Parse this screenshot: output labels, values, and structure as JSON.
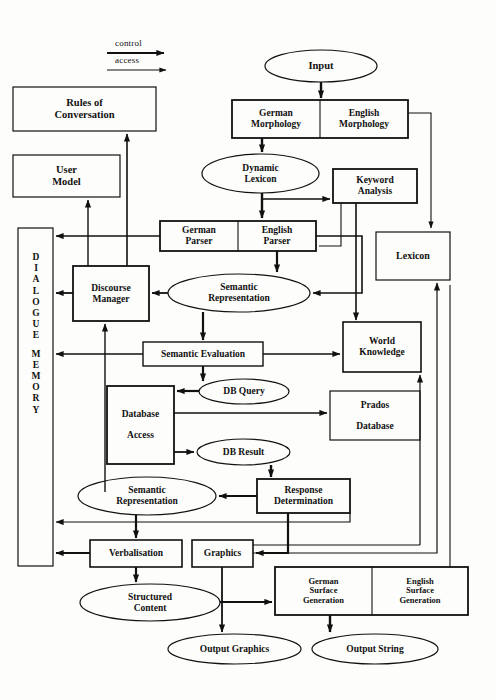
{
  "diagram": {
    "legend": {
      "control_label": "control",
      "access_label": "access"
    },
    "memory_box": {
      "label": "DIALOGUE MEMORY",
      "letters": [
        "D",
        "I",
        "A",
        "L",
        "O",
        "G",
        "U",
        "E",
        "",
        "M",
        "E",
        "M",
        "O",
        "R",
        "Y"
      ]
    },
    "nodes": [
      {
        "id": "rules_of_conversation",
        "label": "Rules of\nConversation",
        "shape": "rect",
        "x": 13,
        "y": 87,
        "w": 143,
        "h": 44,
        "fs": 10.5
      },
      {
        "id": "user_model",
        "label": "User\nModel",
        "shape": "rect",
        "x": 13,
        "y": 155,
        "w": 107,
        "h": 42,
        "fs": 10.5
      },
      {
        "id": "input",
        "label": "Input",
        "shape": "ellipse",
        "x": 265,
        "y": 50,
        "w": 112,
        "h": 32,
        "fs": 10.5
      },
      {
        "id": "german_morphology",
        "label": "German\nMorphology",
        "shape": "rect",
        "x": 232,
        "y": 100,
        "w": 88,
        "h": 38,
        "fs": 9.5
      },
      {
        "id": "english_morphology",
        "label": "English\nMorphology",
        "shape": "rect",
        "x": 320,
        "y": 100,
        "w": 88,
        "h": 38,
        "fs": 9.5
      },
      {
        "id": "dynamic_lexicon",
        "label": "Dynamic\nLexicon",
        "shape": "ellipse",
        "x": 202,
        "y": 154,
        "w": 117,
        "h": 39,
        "fs": 9.5
      },
      {
        "id": "keyword_analysis",
        "label": "Keyword\nAnalysis",
        "shape": "rect",
        "x": 333,
        "y": 169,
        "w": 84,
        "h": 34,
        "fs": 9.5
      },
      {
        "id": "german_parser",
        "label": "German\nParser",
        "shape": "rect",
        "x": 160,
        "y": 221,
        "w": 78,
        "h": 30,
        "fs": 9.5
      },
      {
        "id": "english_parser",
        "label": "English\nParser",
        "shape": "rect",
        "x": 238,
        "y": 221,
        "w": 78,
        "h": 30,
        "fs": 9.5
      },
      {
        "id": "lexicon",
        "label": "Lexicon",
        "shape": "rect",
        "x": 376,
        "y": 232,
        "w": 74,
        "h": 48,
        "fs": 10
      },
      {
        "id": "discourse_manager",
        "label": "Discourse\nManager",
        "shape": "rect",
        "x": 73,
        "y": 266,
        "w": 76,
        "h": 55,
        "fs": 9.5
      },
      {
        "id": "semantic_representation_1",
        "label": "Semantic\nRepresentation",
        "shape": "ellipse",
        "x": 168,
        "y": 274,
        "w": 142,
        "h": 38,
        "fs": 9.5
      },
      {
        "id": "world_knowledge",
        "label": "World\nKnowledge",
        "shape": "rect",
        "x": 343,
        "y": 322,
        "w": 78,
        "h": 50,
        "fs": 9.5
      },
      {
        "id": "semantic_evaluation",
        "label": "Semantic Evaluation",
        "shape": "rect",
        "x": 143,
        "y": 342,
        "w": 120,
        "h": 24,
        "fs": 9.5
      },
      {
        "id": "db_query",
        "label": "DB Query",
        "shape": "ellipse",
        "x": 199,
        "y": 379,
        "w": 90,
        "h": 25,
        "fs": 9.5
      },
      {
        "id": "database_access",
        "label": "Database\n\nAccess",
        "shape": "rect",
        "x": 107,
        "y": 386,
        "w": 67,
        "h": 78,
        "fs": 9.5
      },
      {
        "id": "prados_database",
        "label": "Prados\n\nDatabase",
        "shape": "rect",
        "x": 330,
        "y": 391,
        "w": 90,
        "h": 49,
        "fs": 9.5
      },
      {
        "id": "db_result",
        "label": "DB Result",
        "shape": "ellipse",
        "x": 197,
        "y": 439,
        "w": 93,
        "h": 26,
        "fs": 9.5
      },
      {
        "id": "semantic_representation_2",
        "label": "Semantic\nRepresentation",
        "shape": "ellipse",
        "x": 78,
        "y": 477,
        "w": 138,
        "h": 38,
        "fs": 9.5
      },
      {
        "id": "response_determination",
        "label": "Response\nDetermination",
        "shape": "rect",
        "x": 257,
        "y": 479,
        "w": 93,
        "h": 34,
        "fs": 9.5
      },
      {
        "id": "verbalisation",
        "label": "Verbalisation",
        "shape": "rect",
        "x": 90,
        "y": 540,
        "w": 92,
        "h": 27,
        "fs": 9.5
      },
      {
        "id": "graphics",
        "label": "Graphics",
        "shape": "rect",
        "x": 192,
        "y": 540,
        "w": 61,
        "h": 27,
        "fs": 9.5
      },
      {
        "id": "german_surface_generation",
        "label": "German\nSurface\nGeneration",
        "shape": "rect",
        "x": 275,
        "y": 567,
        "w": 97,
        "h": 48,
        "fs": 8.5
      },
      {
        "id": "english_surface_generation",
        "label": "English\nSurface\nGeneration",
        "shape": "rect",
        "x": 372,
        "y": 567,
        "w": 96,
        "h": 48,
        "fs": 8.5
      },
      {
        "id": "structured_content",
        "label": "Structured\nContent",
        "shape": "ellipse",
        "x": 80,
        "y": 584,
        "w": 140,
        "h": 37,
        "fs": 9.5
      },
      {
        "id": "output_graphics",
        "label": "Output Graphics",
        "shape": "ellipse",
        "x": 168,
        "y": 634,
        "w": 133,
        "h": 30,
        "fs": 9.5
      },
      {
        "id": "output_string",
        "label": "Output String",
        "shape": "ellipse",
        "x": 312,
        "y": 634,
        "w": 126,
        "h": 30,
        "fs": 9.5
      }
    ],
    "colors": {
      "stroke": "#111111",
      "text": "#111111",
      "background": "#fdfdfb"
    }
  }
}
